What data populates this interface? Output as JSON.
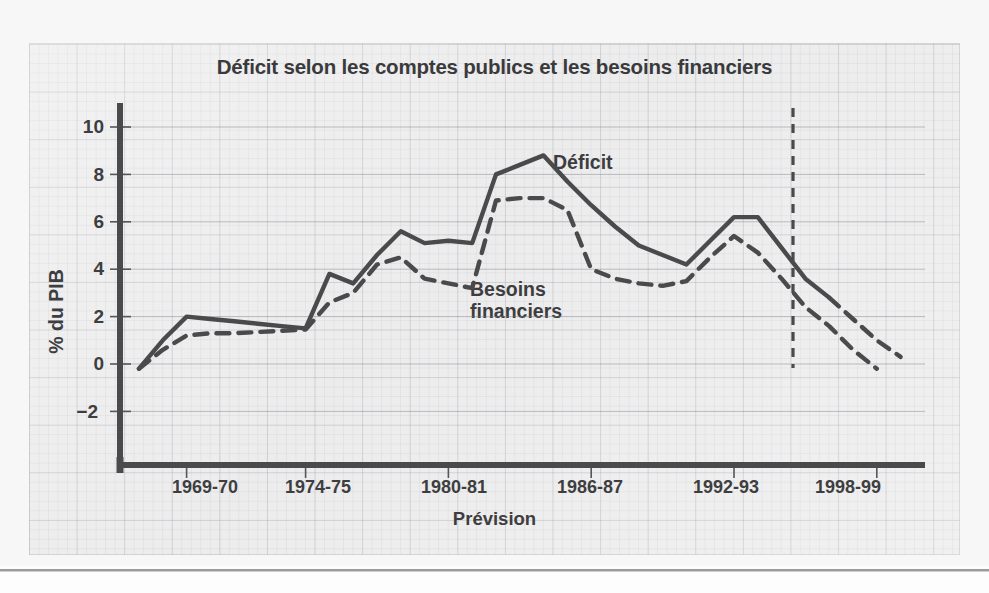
{
  "figure": {
    "title": "Déficit selon les comptes publics et les besoins financiers",
    "colors": {
      "line": "#4a4a4d",
      "text": "#3e3e40",
      "panel": "#ececed",
      "grid": "#a0a2a8"
    }
  },
  "axes": {
    "y_label": "% du PIB",
    "y_ticks": [
      "10",
      "8",
      "6",
      "4",
      "2",
      "0",
      "−2"
    ],
    "x_label": "Prévision",
    "x_ticks": [
      "1969-70",
      "1974-75",
      "1980-81",
      "1986-87",
      "1992-93",
      "1998-99"
    ]
  },
  "annotations": {
    "deficit": "Déficit",
    "besoins_line1": "Besoins",
    "besoins_line2": "financiers"
  },
  "chart_data": {
    "type": "line",
    "title": "Déficit selon les comptes publics et les besoins financiers",
    "xlabel": "Prévision",
    "ylabel": "% du PIB",
    "ylim": [
      -3.2,
      11.2
    ],
    "yticks": [
      10,
      8,
      6,
      4,
      2,
      0,
      -2
    ],
    "grid": true,
    "legend_position": "inline-annotations",
    "x": [
      "1967-68",
      "1968-69",
      "1969-70",
      "1970-71",
      "1971-72",
      "1972-73",
      "1973-74",
      "1974-75",
      "1975-76",
      "1976-77",
      "1977-78",
      "1978-79",
      "1979-80",
      "1980-81",
      "1981-82",
      "1982-83",
      "1983-84",
      "1984-85",
      "1985-86",
      "1986-87",
      "1987-88",
      "1988-89",
      "1989-90",
      "1990-91",
      "1991-92",
      "1992-93",
      "1993-94",
      "1994-95",
      "1995-96",
      "1996-97",
      "1997-98",
      "1998-99"
    ],
    "series": [
      {
        "name": "Déficit",
        "style": "solid",
        "values": [
          -0.2,
          1.0,
          2.0,
          1.9,
          1.8,
          1.7,
          1.6,
          1.5,
          3.8,
          3.4,
          4.6,
          5.6,
          5.1,
          5.2,
          5.1,
          8.0,
          8.4,
          8.8,
          7.7,
          6.7,
          5.8,
          5.0,
          4.6,
          4.2,
          5.2,
          6.2,
          6.2,
          4.9,
          3.6,
          2.8,
          null,
          null
        ],
        "forecast_from": "1996-97",
        "forecast_values": [
          2.8,
          1.9,
          1.0,
          0.3
        ],
        "forecast_style": "dashed"
      },
      {
        "name": "Besoins financiers",
        "style": "dashed",
        "values": [
          -0.2,
          0.6,
          1.2,
          1.3,
          1.3,
          1.35,
          1.4,
          1.45,
          2.6,
          3.0,
          4.2,
          4.5,
          3.6,
          3.4,
          3.2,
          6.9,
          7.0,
          7.0,
          6.5,
          4.0,
          3.6,
          3.4,
          3.3,
          3.5,
          4.5,
          5.4,
          4.7,
          3.6,
          2.4,
          1.6,
          0.6,
          -0.2
        ]
      }
    ],
    "forecast_divider": {
      "label": "Prévision",
      "x_position": "1996-97",
      "style": "dashed-vertical"
    }
  }
}
